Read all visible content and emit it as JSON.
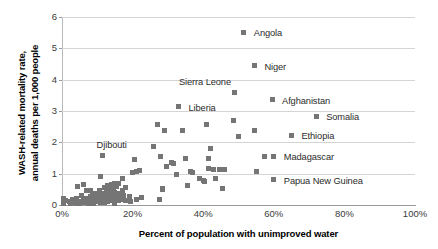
{
  "chart_data": {
    "type": "scatter",
    "title": "",
    "xlabel": "Percent of population with unimproved water",
    "ylabel": "WASH-related  mortality rate, annual deaths per 1,000 people",
    "ylabel_line1": "WASH-related  mortality rate,",
    "ylabel_line2": "annual deaths per 1,000 people",
    "xlim": [
      0,
      100
    ],
    "ylim": [
      0,
      6
    ],
    "xticks": [
      "0%",
      "20%",
      "40%",
      "60%",
      "80%",
      "100%"
    ],
    "xtick_values": [
      0,
      20,
      40,
      60,
      80,
      100
    ],
    "yticks": [
      "0",
      "1",
      "2",
      "3",
      "4",
      "5",
      "6"
    ],
    "ytick_values": [
      0,
      1,
      2,
      3,
      4,
      5,
      6
    ],
    "grid": "horizontal",
    "legend": "none",
    "marker": "square",
    "marker_color": "#757575",
    "gridline_color": "#d4d4d4",
    "annotations": [
      {
        "label": "Angola",
        "x": 51.5,
        "y": 5.52,
        "label_dx": 10,
        "label_dy": -4
      },
      {
        "label": "Niger",
        "x": 54.5,
        "y": 4.45,
        "label_dx": 10,
        "label_dy": -4
      },
      {
        "label": "Sierra Leone",
        "x": 49.0,
        "y": 3.6,
        "label_dx": -56,
        "label_dy": -15
      },
      {
        "label": "Afghanistan",
        "x": 59.5,
        "y": 3.36,
        "label_dx": 10,
        "label_dy": -4
      },
      {
        "label": "Liberia",
        "x": 33.0,
        "y": 3.13,
        "label_dx": 10,
        "label_dy": -4
      },
      {
        "label": "Somalia",
        "x": 72.0,
        "y": 2.83,
        "label_dx": 10,
        "label_dy": -4
      },
      {
        "label": "Ethiopia",
        "x": 65.0,
        "y": 2.22,
        "label_dx": 10,
        "label_dy": -4
      },
      {
        "label": "Madagascar",
        "x": 60.0,
        "y": 1.55,
        "label_dx": 10,
        "label_dy": -4
      },
      {
        "label": "Djibouti",
        "x": 11.5,
        "y": 1.57,
        "label_dx": -6,
        "label_dy": -16
      },
      {
        "label": "Papua New Guinea",
        "x": 60.0,
        "y": 0.8,
        "label_dx": 10,
        "label_dy": -4
      }
    ],
    "points": [
      {
        "x": 0.5,
        "y": 0.22
      },
      {
        "x": 0.5,
        "y": 0.06
      },
      {
        "x": 1.0,
        "y": 0.13
      },
      {
        "x": 2.0,
        "y": 0.1
      },
      {
        "x": 2.5,
        "y": 0.05
      },
      {
        "x": 3.0,
        "y": 0.18
      },
      {
        "x": 3.5,
        "y": 0.08
      },
      {
        "x": 4.0,
        "y": 0.22
      },
      {
        "x": 4.0,
        "y": 0.06
      },
      {
        "x": 4.5,
        "y": 0.6
      },
      {
        "x": 5.0,
        "y": 0.12
      },
      {
        "x": 5.0,
        "y": 0.04
      },
      {
        "x": 5.5,
        "y": 0.3
      },
      {
        "x": 6.0,
        "y": 0.64
      },
      {
        "x": 6.0,
        "y": 0.16
      },
      {
        "x": 6.5,
        "y": 0.08
      },
      {
        "x": 7.0,
        "y": 0.46
      },
      {
        "x": 7.0,
        "y": 0.2
      },
      {
        "x": 7.5,
        "y": 0.05
      },
      {
        "x": 8.0,
        "y": 0.47
      },
      {
        "x": 8.0,
        "y": 0.26
      },
      {
        "x": 8.0,
        "y": 0.1
      },
      {
        "x": 8.5,
        "y": 0.33
      },
      {
        "x": 9.0,
        "y": 0.18
      },
      {
        "x": 9.0,
        "y": 0.06
      },
      {
        "x": 9.5,
        "y": 0.37
      },
      {
        "x": 10.0,
        "y": 0.25
      },
      {
        "x": 10.0,
        "y": 0.11
      },
      {
        "x": 10.5,
        "y": 0.46
      },
      {
        "x": 10.5,
        "y": 0.19
      },
      {
        "x": 11.0,
        "y": 0.9
      },
      {
        "x": 11.0,
        "y": 0.3
      },
      {
        "x": 11.0,
        "y": 0.09
      },
      {
        "x": 11.5,
        "y": 1.57
      },
      {
        "x": 11.5,
        "y": 0.38
      },
      {
        "x": 11.5,
        "y": 0.15
      },
      {
        "x": 12.0,
        "y": 0.55
      },
      {
        "x": 12.0,
        "y": 0.27
      },
      {
        "x": 12.0,
        "y": 0.07
      },
      {
        "x": 12.5,
        "y": 0.42
      },
      {
        "x": 12.5,
        "y": 0.2
      },
      {
        "x": 13.0,
        "y": 0.63
      },
      {
        "x": 13.0,
        "y": 0.31
      },
      {
        "x": 13.0,
        "y": 0.12
      },
      {
        "x": 13.5,
        "y": 0.48
      },
      {
        "x": 13.5,
        "y": 0.22
      },
      {
        "x": 14.0,
        "y": 0.66
      },
      {
        "x": 14.0,
        "y": 0.35
      },
      {
        "x": 14.0,
        "y": 0.14
      },
      {
        "x": 14.5,
        "y": 0.52
      },
      {
        "x": 14.5,
        "y": 0.25
      },
      {
        "x": 15.0,
        "y": 0.7
      },
      {
        "x": 15.0,
        "y": 0.4
      },
      {
        "x": 15.0,
        "y": 0.17
      },
      {
        "x": 15.0,
        "y": 0.05
      },
      {
        "x": 15.5,
        "y": 0.58
      },
      {
        "x": 15.5,
        "y": 0.28
      },
      {
        "x": 16.0,
        "y": 0.68
      },
      {
        "x": 16.0,
        "y": 0.36
      },
      {
        "x": 16.0,
        "y": 0.13
      },
      {
        "x": 16.5,
        "y": 0.24
      },
      {
        "x": 17.0,
        "y": 0.85
      },
      {
        "x": 17.0,
        "y": 0.45
      },
      {
        "x": 17.0,
        "y": 0.18
      },
      {
        "x": 17.5,
        "y": 0.3
      },
      {
        "x": 18.0,
        "y": 0.57
      },
      {
        "x": 18.0,
        "y": 0.14
      },
      {
        "x": 19.0,
        "y": 0.26
      },
      {
        "x": 19.5,
        "y": 0.12
      },
      {
        "x": 20.0,
        "y": 1.03
      },
      {
        "x": 20.5,
        "y": 1.45
      },
      {
        "x": 21.0,
        "y": 1.06
      },
      {
        "x": 21.0,
        "y": 0.16
      },
      {
        "x": 22.0,
        "y": 1.11
      },
      {
        "x": 22.5,
        "y": 0.23
      },
      {
        "x": 26.0,
        "y": 1.86
      },
      {
        "x": 27.0,
        "y": 2.57
      },
      {
        "x": 27.5,
        "y": 0.18
      },
      {
        "x": 28.0,
        "y": 1.56
      },
      {
        "x": 28.5,
        "y": 0.53
      },
      {
        "x": 28.5,
        "y": 0.48
      },
      {
        "x": 29.0,
        "y": 2.38
      },
      {
        "x": 29.5,
        "y": 1.23
      },
      {
        "x": 31.0,
        "y": 1.35
      },
      {
        "x": 31.5,
        "y": 1.31
      },
      {
        "x": 32.5,
        "y": 0.96
      },
      {
        "x": 33.0,
        "y": 3.13
      },
      {
        "x": 34.0,
        "y": 2.39
      },
      {
        "x": 35.0,
        "y": 1.47
      },
      {
        "x": 35.5,
        "y": 0.61
      },
      {
        "x": 36.5,
        "y": 1.07
      },
      {
        "x": 37.0,
        "y": 1.04
      },
      {
        "x": 39.0,
        "y": 0.83
      },
      {
        "x": 40.0,
        "y": 0.78
      },
      {
        "x": 40.5,
        "y": 0.74
      },
      {
        "x": 41.0,
        "y": 2.57
      },
      {
        "x": 41.5,
        "y": 1.47
      },
      {
        "x": 41.5,
        "y": 1.17
      },
      {
        "x": 42.0,
        "y": 1.81
      },
      {
        "x": 43.0,
        "y": 1.13
      },
      {
        "x": 43.5,
        "y": 0.86
      },
      {
        "x": 44.5,
        "y": 1.12
      },
      {
        "x": 45.5,
        "y": 0.54
      },
      {
        "x": 46.0,
        "y": 1.13
      },
      {
        "x": 48.5,
        "y": 2.71
      },
      {
        "x": 49.0,
        "y": 3.6
      },
      {
        "x": 50.0,
        "y": 2.19
      },
      {
        "x": 51.5,
        "y": 5.52
      },
      {
        "x": 54.5,
        "y": 4.45
      },
      {
        "x": 54.5,
        "y": 2.38
      },
      {
        "x": 55.0,
        "y": 1.08
      },
      {
        "x": 57.5,
        "y": 1.55
      },
      {
        "x": 59.5,
        "y": 3.36
      },
      {
        "x": 60.0,
        "y": 1.55
      },
      {
        "x": 60.0,
        "y": 0.8
      },
      {
        "x": 65.0,
        "y": 2.22
      },
      {
        "x": 72.0,
        "y": 2.83
      }
    ]
  }
}
